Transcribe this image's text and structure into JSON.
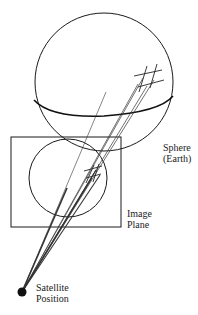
{
  "diagram": {
    "labels": {
      "sphere_line1": "Sphere",
      "sphere_line2": "(Earth)",
      "image_line1": "Image",
      "image_line2": "Plane",
      "satellite_line1": "Satellite",
      "satellite_line2": "Position"
    },
    "elements": [
      {
        "name": "sphere",
        "shape": "circle",
        "represents": "Earth"
      },
      {
        "name": "equator",
        "shape": "arc"
      },
      {
        "name": "image-plane",
        "shape": "rectangle"
      },
      {
        "name": "projected-disk",
        "shape": "circle",
        "inside": "image-plane"
      },
      {
        "name": "satellite",
        "shape": "filled-dot"
      },
      {
        "name": "grid-on-sphere",
        "shape": "grid-marks"
      },
      {
        "name": "projection-rays",
        "shape": "lines",
        "from": "satellite",
        "to": "grid-on-sphere"
      }
    ],
    "colors": {
      "stroke": "#1a1a1a",
      "background": "#ffffff"
    }
  }
}
